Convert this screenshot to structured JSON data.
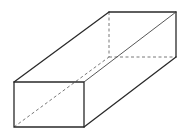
{
  "diagram": {
    "type": "rectangular-prism",
    "stroke_color": "#2a2a2a",
    "background": "#ffffff",
    "vertices": {
      "A_front_top_left": [
        14,
        82
      ],
      "B_front_top_right": [
        84,
        82
      ],
      "C_front_bottom_right": [
        84,
        127
      ],
      "D_front_bottom_left": [
        14,
        127
      ],
      "E_back_top_left": [
        109,
        12
      ],
      "F_back_top_right": [
        176,
        12
      ],
      "G_back_bottom_right": [
        176,
        57
      ],
      "H_back_bottom_left": [
        109,
        57
      ]
    },
    "visible_edges": [
      [
        "A_front_top_left",
        "B_front_top_right"
      ],
      [
        "B_front_top_right",
        "C_front_bottom_right"
      ],
      [
        "C_front_bottom_right",
        "D_front_bottom_left"
      ],
      [
        "D_front_bottom_left",
        "A_front_top_left"
      ],
      [
        "A_front_top_left",
        "E_back_top_left"
      ],
      [
        "E_back_top_left",
        "F_back_top_right"
      ],
      [
        "F_back_top_right",
        "G_back_bottom_right"
      ],
      [
        "B_front_top_right",
        "F_back_top_right"
      ],
      [
        "C_front_bottom_right",
        "G_back_bottom_right"
      ]
    ],
    "hidden_edges": [
      [
        "E_back_top_left",
        "H_back_bottom_left"
      ],
      [
        "H_back_bottom_left",
        "G_back_bottom_right"
      ],
      [
        "D_front_bottom_left",
        "H_back_bottom_left"
      ]
    ],
    "labels": []
  }
}
